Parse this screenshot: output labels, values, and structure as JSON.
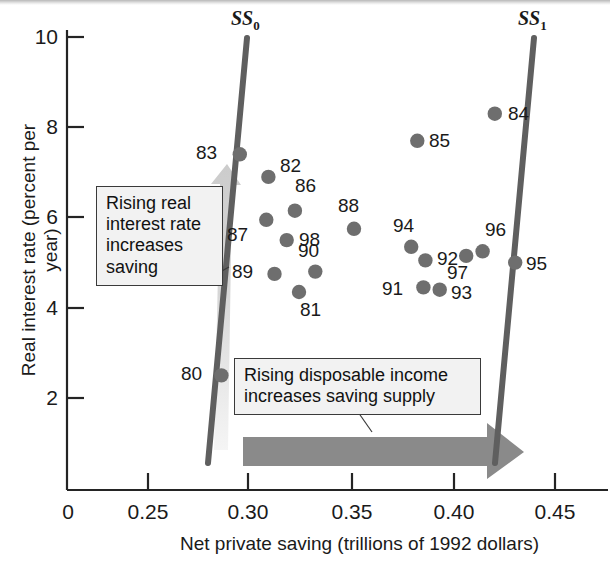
{
  "figure": {
    "domain": "chart",
    "bg_color": "#ffffff",
    "accent_color": "#6b6b6b",
    "marker_color": "#6e6e6e",
    "line_color": "#5f5f5f"
  },
  "callouts": {
    "saving": "Rising real interest rate increases saving",
    "supply": "Rising disposable income increases saving supply"
  },
  "curves": {
    "ss0_label": "SS",
    "ss0_sub": "0",
    "ss1_label": "SS",
    "ss1_sub": "1"
  },
  "chart_data": {
    "type": "scatter",
    "title": "",
    "xlabel": "Net private saving (trillions of 1992 dollars)",
    "ylabel": "Real interest rate (percent per year)",
    "xlim": [
      0.215,
      0.465
    ],
    "ylim": [
      0,
      10.8
    ],
    "xticks": [
      0.25,
      0.3,
      0.35,
      0.4,
      0.45
    ],
    "xticklabels": [
      "0.25",
      "0.30",
      "0.35",
      "0.40",
      "0.45"
    ],
    "origin_label": "0",
    "yticks": [
      2,
      4,
      6,
      8,
      10
    ],
    "yticklabels": [
      "2",
      "4",
      "6",
      "8",
      "10"
    ],
    "grid": false,
    "legend": false,
    "points": [
      {
        "label": "80",
        "x": 0.286,
        "y": 2.5,
        "lx": -26,
        "ly": -2
      },
      {
        "label": "83",
        "x": 0.295,
        "y": 7.4,
        "lx": -30,
        "ly": -2
      },
      {
        "label": "82",
        "x": 0.309,
        "y": 6.9,
        "lx": 12,
        "ly": -12
      },
      {
        "label": "86",
        "x": 0.322,
        "y": 6.15,
        "lx": 0,
        "ly": -26
      },
      {
        "label": "87",
        "x": 0.308,
        "y": 5.95,
        "lx": -25,
        "ly": 14
      },
      {
        "label": "98",
        "x": 0.318,
        "y": 5.5,
        "lx": 12,
        "ly": -1
      },
      {
        "label": "89",
        "x": 0.312,
        "y": 4.75,
        "lx": -28,
        "ly": -3
      },
      {
        "label": "90",
        "x": 0.332,
        "y": 4.8,
        "lx": -3,
        "ly": -22
      },
      {
        "label": "81",
        "x": 0.324,
        "y": 4.35,
        "lx": 1,
        "ly": 17
      },
      {
        "label": "88",
        "x": 0.351,
        "y": 5.75,
        "lx": -2,
        "ly": -24
      },
      {
        "label": "85",
        "x": 0.382,
        "y": 7.7,
        "lx": 12,
        "ly": -1
      },
      {
        "label": "84",
        "x": 0.42,
        "y": 8.3,
        "lx": 13,
        "ly": -1
      },
      {
        "label": "94",
        "x": 0.379,
        "y": 5.35,
        "lx": -4,
        "ly": -22
      },
      {
        "label": "92",
        "x": 0.386,
        "y": 5.05,
        "lx": 12,
        "ly": -2
      },
      {
        "label": "91",
        "x": 0.385,
        "y": 4.45,
        "lx": -27,
        "ly": 1
      },
      {
        "label": "93",
        "x": 0.393,
        "y": 4.4,
        "lx": 11,
        "ly": 2
      },
      {
        "label": "97",
        "x": 0.406,
        "y": 5.15,
        "lx": -5,
        "ly": 16
      },
      {
        "label": "96",
        "x": 0.414,
        "y": 5.25,
        "lx": 2,
        "ly": -22
      },
      {
        "label": "95",
        "x": 0.43,
        "y": 5.0,
        "lx": 11,
        "ly": 0
      }
    ],
    "annotations": [
      {
        "name": "ss0-curve",
        "type": "line",
        "x_bottom": 0.283,
        "x_top": 0.302
      },
      {
        "name": "ss1-curve",
        "type": "line",
        "x_bottom": 0.424,
        "x_top": 0.442
      },
      {
        "name": "up-arrow",
        "type": "arrow",
        "direction": "up"
      },
      {
        "name": "right-arrow",
        "type": "arrow",
        "direction": "right"
      }
    ]
  }
}
